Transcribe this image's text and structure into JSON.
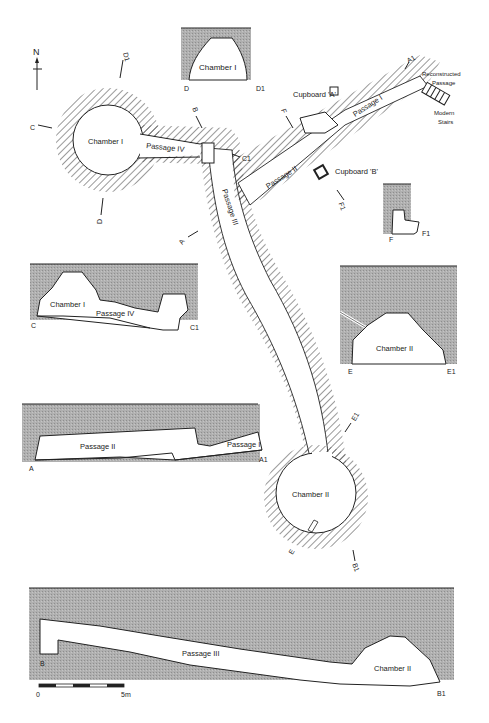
{
  "plan": {
    "north_label": "N",
    "chamber_1": "Chamber I",
    "chamber_2": "Chamber II",
    "passage_1": "Passage I",
    "passage_2": "Passage II",
    "passage_3": "Passage III",
    "passage_4": "Passage IV",
    "cupboard_a": "Cupboard 'A'",
    "cupboard_b": "Cupboard 'B'",
    "reconstructed_1": "Reconstructed",
    "reconstructed_2": "Passage",
    "stairs_1": "Modern",
    "stairs_2": "Stairs",
    "section_markers": {
      "A": "A",
      "A1": "A1",
      "B": "B",
      "B1": "B1",
      "C": "C",
      "C1": "C1",
      "D": "D",
      "D1": "D1",
      "E": "E",
      "E1": "E1",
      "F": "F",
      "F1": "F1"
    }
  },
  "sections": {
    "DD1": {
      "label": "Chamber I",
      "start": "D",
      "end": "D1"
    },
    "FF1": {
      "start": "F",
      "end": "F1"
    },
    "CC1": {
      "label_1": "Chamber I",
      "label_2": "Passage IV",
      "start": "C",
      "end": "C1"
    },
    "EE1": {
      "label": "Chamber II",
      "start": "E",
      "end": "E1"
    },
    "AA1": {
      "label_1": "Passage II",
      "label_2": "Passage I",
      "start": "A",
      "end": "A1"
    },
    "BB1": {
      "label_1": "Passage III",
      "label_2": "Chamber II",
      "start": "B",
      "end": "B1"
    }
  },
  "scale_bar": {
    "start": "0",
    "end": "5m"
  },
  "colors": {
    "rock_fill": "#a9a9a9",
    "line": "#1a1a1a",
    "background": "#ffffff"
  }
}
